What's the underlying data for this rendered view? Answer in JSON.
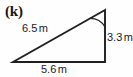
{
  "figure": {
    "item_label": "(k)",
    "shape": "right-triangle",
    "background_color": "#fefefe",
    "stroke_color": "#1f1f1f",
    "text_color": "#1a1a1a"
  },
  "labels": {
    "hypotenuse": {
      "value": "6.5",
      "unit": "m"
    },
    "vertical_side": {
      "value": "3.3",
      "unit": "m"
    },
    "base": {
      "value": "5.6",
      "unit": "m"
    }
  },
  "geometry": {
    "apex": {
      "x": 105,
      "y": 10
    },
    "bottom_left": {
      "x": 13,
      "y": 62
    },
    "bottom_right": {
      "x": 105,
      "y": 62
    },
    "angle_arc": {
      "vertex": "apex",
      "radius": 17
    }
  }
}
